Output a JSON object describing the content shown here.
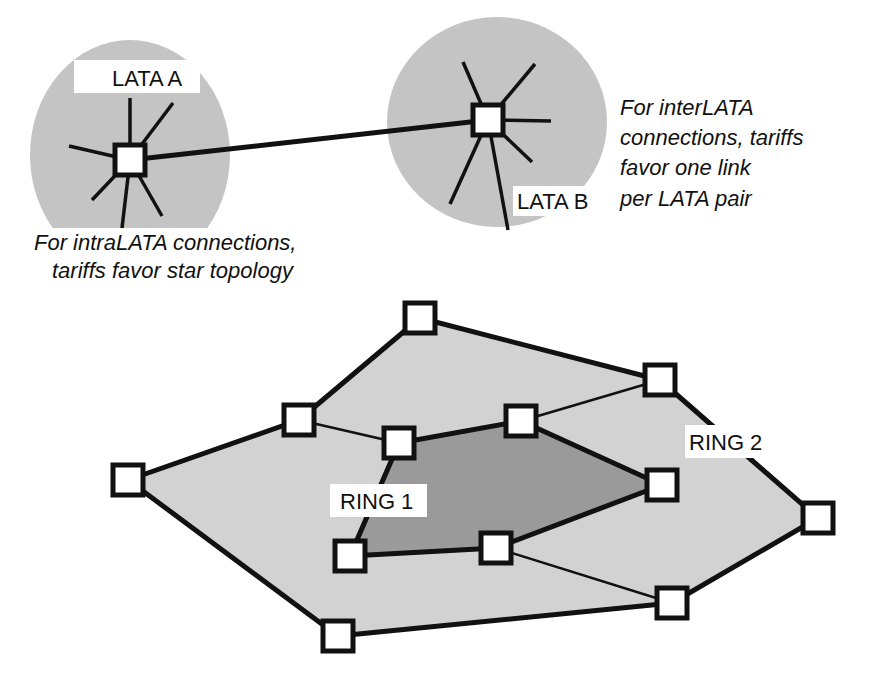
{
  "colors": {
    "region_fill": "#c4c4c4",
    "ring2_fill": "#d2d2d2",
    "ring1_fill": "#9a9a9a",
    "line": "#111111",
    "node_fill": "#ffffff"
  },
  "top": {
    "lata_a": {
      "label": "LATA A",
      "caption_line1": "For intraLATA connections,",
      "caption_line2": "tariffs favor star topology"
    },
    "lata_b": {
      "label": "LATA B",
      "caption_line1": "For interLATA",
      "caption_line2": "connections, tariffs",
      "caption_line3": "favor one link",
      "caption_line4": "per LATA pair"
    }
  },
  "rings": {
    "ring1_label": "RING 1",
    "ring2_label": "RING 2",
    "ring2_nodes": [
      [
        128,
        480
      ],
      [
        299,
        420
      ],
      [
        420,
        318
      ],
      [
        660,
        380
      ],
      [
        818,
        518
      ],
      [
        672,
        603
      ],
      [
        338,
        636
      ]
    ],
    "ring1_nodes": [
      [
        399,
        443
      ],
      [
        521,
        421
      ],
      [
        662,
        485
      ],
      [
        496,
        548
      ],
      [
        350,
        556
      ]
    ]
  }
}
